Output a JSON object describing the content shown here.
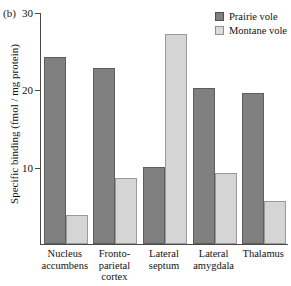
{
  "panel": {
    "letter": "(b)"
  },
  "legend": {
    "entries": [
      {
        "label": "Prairie vole",
        "color": "#808080"
      },
      {
        "label": "Montane vole",
        "color": "#d5d5d5"
      }
    ]
  },
  "axes": {
    "ylabel": "Specific binding (fmol / mg protein)",
    "yticks": [
      "10",
      "20",
      "30"
    ]
  },
  "chart_data": {
    "type": "bar",
    "title": "",
    "xlabel": "",
    "ylabel": "Specific binding (fmol / mg protein)",
    "ylim": [
      0,
      30
    ],
    "yticks": [
      10,
      20,
      30
    ],
    "grid": false,
    "legend_position": "top-right",
    "categories": [
      "Nucleus accumbens",
      "Fronto-parietal cortex",
      "Lateral septum",
      "Lateral amygdala",
      "Thalamus"
    ],
    "category_lines": [
      [
        "Nucleus",
        "accumbens"
      ],
      [
        "Fronto-",
        "parietal",
        "cortex"
      ],
      [
        "Lateral",
        "septum"
      ],
      [
        "Lateral",
        "amygdala"
      ],
      [
        "Thalamus"
      ]
    ],
    "series": [
      {
        "name": "Prairie vole",
        "color": "#808080",
        "values": [
          24.2,
          22.7,
          9.9,
          20.2,
          19.5
        ]
      },
      {
        "name": "Montane vole",
        "color": "#d5d5d5",
        "values": [
          3.8,
          8.5,
          27.2,
          9.2,
          5.6
        ]
      }
    ]
  }
}
